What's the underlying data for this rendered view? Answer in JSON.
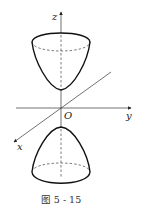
{
  "figure": {
    "type": "two-sheeted hyperboloid (paraboloid-like sheets) in 3D axes",
    "axes": {
      "x_label": "x",
      "y_label": "y",
      "z_label": "z",
      "origin_label": "O"
    },
    "sheets": [
      {
        "name": "upper-sheet",
        "opens": "up"
      },
      {
        "name": "lower-sheet",
        "opens": "down"
      }
    ],
    "caption": "图 5 - 15"
  }
}
